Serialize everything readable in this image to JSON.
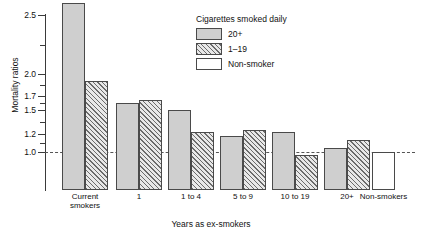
{
  "chart_data": {
    "type": "bar",
    "title": "",
    "xlabel": "Years as ex-smokers",
    "ylabel": "Mortality ratios",
    "categories": [
      "Current smokers",
      "1",
      "1 to 4",
      "5 to 9",
      "10 to 19",
      "20+",
      "Non-smokers"
    ],
    "ytick_labels": [
      "1.0",
      "1.2",
      "1.5",
      "1.7",
      "2.0",
      "2.5"
    ],
    "ytick_values": [
      1.0,
      1.2,
      1.5,
      1.7,
      2.0,
      2.5
    ],
    "ylim": [
      0.9,
      2.6
    ],
    "yscale": "log-like non-linear",
    "grid": false,
    "reference_line": 1.0,
    "legend_title": "Cigarettes smoked daily",
    "legend_position": "top-center",
    "series": [
      {
        "name": "20+",
        "values": [
          2.6,
          1.6,
          1.5,
          1.18,
          1.22,
          1.04,
          null
        ]
      },
      {
        "name": "1–19",
        "values": [
          1.9,
          1.65,
          1.22,
          1.25,
          0.97,
          1.13,
          null
        ]
      },
      {
        "name": "Non-smoker",
        "values": [
          null,
          null,
          null,
          null,
          null,
          null,
          1.0
        ]
      }
    ]
  },
  "axes": {
    "ylabel": "Mortality ratios",
    "xlabel": "Years as ex-smokers",
    "yticks": [
      {
        "label": "2.5",
        "value": 2.5
      },
      {
        "label": "2.0",
        "value": 2.0
      },
      {
        "label": "1.7",
        "value": 1.7
      },
      {
        "label": "1.5",
        "value": 1.5
      },
      {
        "label": "1.2",
        "value": 1.2
      },
      {
        "label": "1.0",
        "value": 1.0
      }
    ]
  },
  "legend": {
    "title": "Cigarettes smoked daily",
    "items": [
      {
        "label": "20+",
        "swatch": "solid"
      },
      {
        "label": "1–19",
        "swatch": "hatch"
      },
      {
        "label": "Non-smoker",
        "swatch": "open"
      }
    ]
  },
  "groups": [
    {
      "label": "Current smokers",
      "line1": "Current",
      "line2": "smokers"
    },
    {
      "label": "1",
      "line1": "1",
      "line2": ""
    },
    {
      "label": "1 to 4",
      "line1": "1 to 4",
      "line2": ""
    },
    {
      "label": "5 to 9",
      "line1": "5 to 9",
      "line2": ""
    },
    {
      "label": "10 to 19",
      "line1": "10 to 19",
      "line2": ""
    },
    {
      "label": "20+",
      "line1": "20+",
      "line2": ""
    },
    {
      "label": "Non-smokers",
      "line1": "Non-smokers",
      "line2": ""
    }
  ],
  "colors": {
    "solid_fill": "#cfcfcf",
    "hatch_line": "#6b6b6b",
    "open_fill": "#ffffff",
    "bar_border": "#4a4a4a",
    "axis": "#3a3a3a",
    "refline": "#555555"
  }
}
